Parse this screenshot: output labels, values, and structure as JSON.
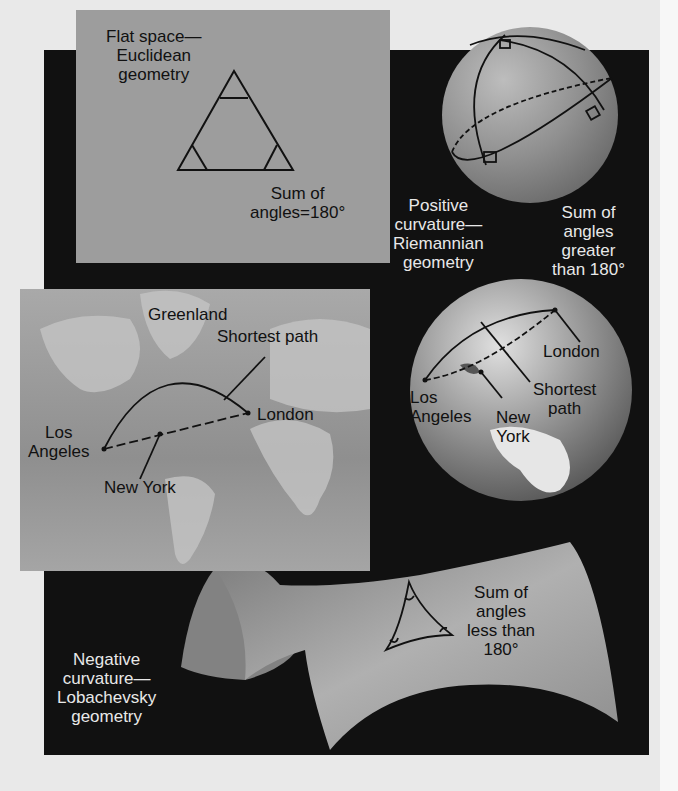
{
  "colors": {
    "page_bg": "#e9e9e9",
    "panel_bg": "#111111",
    "flat_panel": "#9d9d9d",
    "sphere": "#8e8e8e",
    "label_dark": "#111111",
    "label_light": "#e8e8e8"
  },
  "flat": {
    "title_line1": "Flat space—",
    "title_line2": "Euclidean",
    "title_line3": "geometry",
    "sum_line1": "Sum of",
    "sum_line2": "angles=180°"
  },
  "positive": {
    "title_line1": "Positive",
    "title_line2": "curvature—",
    "title_line3": "Riemannian",
    "title_line4": "geometry",
    "sum_line1": "Sum of",
    "sum_line2": "angles",
    "sum_line3": "greater",
    "sum_line4": "than 180°"
  },
  "map": {
    "greenland": "Greenland",
    "shortest_path": "Shortest path",
    "los_angeles_line1": "Los",
    "los_angeles_line2": "Angeles",
    "london": "London",
    "new_york": "New York"
  },
  "globe": {
    "london": "London",
    "shortest_line1": "Shortest",
    "shortest_line2": "path",
    "los_angeles_line1": "Los",
    "los_angeles_line2": "Angeles",
    "new_york_line1": "New",
    "new_york_line2": "York"
  },
  "negative": {
    "title_line1": "Negative",
    "title_line2": "curvature—",
    "title_line3": "Lobachevsky",
    "title_line4": "geometry",
    "sum_line1": "Sum of",
    "sum_line2": "angles",
    "sum_line3": "less than",
    "sum_line4": "180°"
  }
}
